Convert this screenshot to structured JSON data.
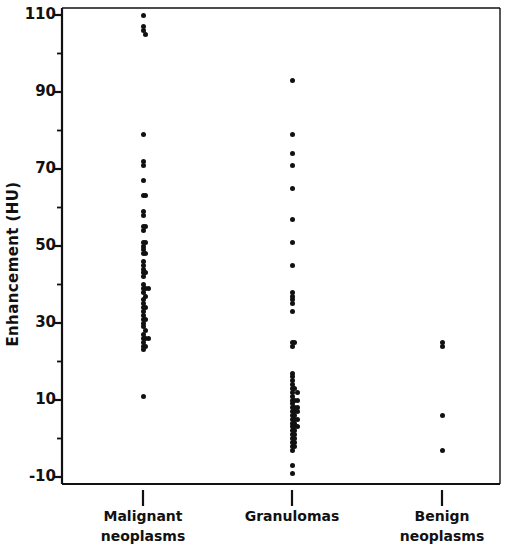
{
  "chart_data": {
    "type": "scatter",
    "title": "",
    "xlabel": "",
    "ylabel": "Enhancement (HU)",
    "ylim": [
      -10,
      110
    ],
    "ytick_labels": [
      "110",
      "90",
      "70",
      "50",
      "30",
      "10",
      "-10"
    ],
    "ytick_values": [
      110,
      90,
      70,
      50,
      30,
      10,
      -10
    ],
    "minor_ytick_values": [
      100,
      80,
      60,
      40,
      20,
      0
    ],
    "grid": false,
    "legend": "none",
    "categories": [
      "Malignant neoplasms",
      "Granulomas",
      "Benign neoplasms"
    ],
    "category_lines": [
      [
        "Malignant",
        "neoplasms"
      ],
      [
        "Granulomas",
        ""
      ],
      [
        "Benign",
        "neoplasms"
      ]
    ],
    "marker_color": "#111111",
    "axis_color": "#111111",
    "series": [
      {
        "name": "Malignant neoplasms",
        "category_index": 0,
        "n": 56,
        "points": [
          {
            "x": 0,
            "y": 110
          },
          {
            "x": 0,
            "y": 107
          },
          {
            "x": 0,
            "y": 106
          },
          {
            "x": 0.22,
            "y": 105
          },
          {
            "x": 0,
            "y": 79
          },
          {
            "x": 0,
            "y": 72
          },
          {
            "x": 0,
            "y": 71
          },
          {
            "x": 0,
            "y": 67
          },
          {
            "x": 0,
            "y": 63
          },
          {
            "x": 0.26,
            "y": 63
          },
          {
            "x": 0,
            "y": 59
          },
          {
            "x": 0,
            "y": 58
          },
          {
            "x": 0,
            "y": 55
          },
          {
            "x": 0.26,
            "y": 55
          },
          {
            "x": 0,
            "y": 54
          },
          {
            "x": 0,
            "y": 51
          },
          {
            "x": 0.26,
            "y": 51
          },
          {
            "x": 0,
            "y": 50
          },
          {
            "x": 0,
            "y": 49
          },
          {
            "x": 0,
            "y": 48
          },
          {
            "x": 0.26,
            "y": 48
          },
          {
            "x": 0,
            "y": 46
          },
          {
            "x": 0,
            "y": 45
          },
          {
            "x": 0,
            "y": 44
          },
          {
            "x": 0,
            "y": 43
          },
          {
            "x": 0,
            "y": 42
          },
          {
            "x": 0.26,
            "y": 43
          },
          {
            "x": 0,
            "y": 40
          },
          {
            "x": 0,
            "y": 39
          },
          {
            "x": 0.26,
            "y": 39
          },
          {
            "x": 0.5,
            "y": 39
          },
          {
            "x": 0,
            "y": 38
          },
          {
            "x": 0.26,
            "y": 37
          },
          {
            "x": 0,
            "y": 36
          },
          {
            "x": 0,
            "y": 35
          },
          {
            "x": 0,
            "y": 34
          },
          {
            "x": 0.26,
            "y": 34
          },
          {
            "x": 0,
            "y": 33
          },
          {
            "x": 0,
            "y": 32
          },
          {
            "x": 0,
            "y": 31
          },
          {
            "x": 0.26,
            "y": 31
          },
          {
            "x": 0,
            "y": 30
          },
          {
            "x": 0,
            "y": 29
          },
          {
            "x": 0.26,
            "y": 28
          },
          {
            "x": 0,
            "y": 27
          },
          {
            "x": 0,
            "y": 26
          },
          {
            "x": 0.26,
            "y": 26
          },
          {
            "x": 0.5,
            "y": 26
          },
          {
            "x": 0,
            "y": 25
          },
          {
            "x": 0,
            "y": 24
          },
          {
            "x": 0.26,
            "y": 24
          },
          {
            "x": 0,
            "y": 23
          },
          {
            "x": 0,
            "y": 11
          }
        ]
      },
      {
        "name": "Granulomas",
        "category_index": 1,
        "n": 60,
        "points": [
          {
            "x": 0,
            "y": 93
          },
          {
            "x": 0,
            "y": 79
          },
          {
            "x": 0,
            "y": 74
          },
          {
            "x": 0,
            "y": 71
          },
          {
            "x": 0,
            "y": 65
          },
          {
            "x": 0,
            "y": 57
          },
          {
            "x": 0,
            "y": 51
          },
          {
            "x": 0,
            "y": 45
          },
          {
            "x": 0,
            "y": 38
          },
          {
            "x": 0,
            "y": 37
          },
          {
            "x": 0,
            "y": 36
          },
          {
            "x": 0,
            "y": 35
          },
          {
            "x": 0,
            "y": 33
          },
          {
            "x": 0,
            "y": 25
          },
          {
            "x": 0.26,
            "y": 25
          },
          {
            "x": 0,
            "y": 24
          },
          {
            "x": 0,
            "y": 17
          },
          {
            "x": 0,
            "y": 16
          },
          {
            "x": 0,
            "y": 15
          },
          {
            "x": 0,
            "y": 14
          },
          {
            "x": 0,
            "y": 13
          },
          {
            "x": 0.26,
            "y": 13
          },
          {
            "x": 0.48,
            "y": 12
          },
          {
            "x": 0,
            "y": 12
          },
          {
            "x": 0,
            "y": 11
          },
          {
            "x": 0,
            "y": 10
          },
          {
            "x": 0.26,
            "y": 10
          },
          {
            "x": 0.5,
            "y": 10
          },
          {
            "x": 0,
            "y": 9
          },
          {
            "x": 0,
            "y": 8
          },
          {
            "x": 0.26,
            "y": 8
          },
          {
            "x": 0.5,
            "y": 8
          },
          {
            "x": 0,
            "y": 7
          },
          {
            "x": 0.26,
            "y": 7
          },
          {
            "x": 0.5,
            "y": 7
          },
          {
            "x": 0,
            "y": 6
          },
          {
            "x": 0.26,
            "y": 6
          },
          {
            "x": 0,
            "y": 5
          },
          {
            "x": 0.26,
            "y": 5
          },
          {
            "x": 0.5,
            "y": 5
          },
          {
            "x": 0,
            "y": 4
          },
          {
            "x": 0.26,
            "y": 4
          },
          {
            "x": 0,
            "y": 3
          },
          {
            "x": 0.26,
            "y": 3
          },
          {
            "x": 0.5,
            "y": 3
          },
          {
            "x": 0,
            "y": 2
          },
          {
            "x": 0.26,
            "y": 2
          },
          {
            "x": 0,
            "y": 1
          },
          {
            "x": 0.26,
            "y": 1
          },
          {
            "x": 0,
            "y": 0
          },
          {
            "x": 0.26,
            "y": 0
          },
          {
            "x": 0,
            "y": -1
          },
          {
            "x": 0.26,
            "y": -1
          },
          {
            "x": 0,
            "y": -2
          },
          {
            "x": 0.26,
            "y": -2
          },
          {
            "x": 0,
            "y": -3
          },
          {
            "x": 0,
            "y": -7
          },
          {
            "x": 0,
            "y": -9
          }
        ]
      },
      {
        "name": "Benign neoplasms",
        "category_index": 2,
        "n": 4,
        "points": [
          {
            "x": 0,
            "y": 25
          },
          {
            "x": 0,
            "y": 24
          },
          {
            "x": 0,
            "y": 6
          },
          {
            "x": 0,
            "y": -3
          }
        ]
      }
    ]
  },
  "axis_geometry": {
    "plot_left": 62,
    "plot_right": 500,
    "plot_top": 8,
    "plot_bottom": 484,
    "y_top_value": 110,
    "y_bottom_value": -10,
    "y_top_px": 15,
    "y_bottom_px": 477,
    "category_x_px": [
      143,
      292,
      442
    ],
    "dot_spacing_px": 11
  }
}
